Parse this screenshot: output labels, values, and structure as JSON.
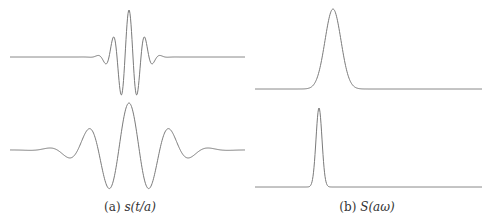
{
  "chart_data": [
    {
      "type": "line",
      "panel": "a",
      "caption": "(a) s(t/a)",
      "description": "Wavelet s(t/a), small scale a (compressed, top) and larger scale a (dilated, bottom)",
      "series": [
        {
          "name": "small scale",
          "shape": "gabor-like wavelet",
          "center_x": 129,
          "baseline_y": 57,
          "peak_y": 10,
          "trough_y": 93,
          "oscillation_period_px": 16,
          "envelope_sigma_px": 12
        },
        {
          "name": "large scale",
          "shape": "gabor-like wavelet",
          "center_x": 129,
          "baseline_y": 150,
          "peak_y": 103,
          "trough_y": 187,
          "oscillation_period_px": 41,
          "envelope_sigma_px": 32
        }
      ],
      "grid": false,
      "axes": false
    },
    {
      "type": "line",
      "panel": "b",
      "caption": "(b) S(aω)",
      "description": "Spectrum S(aω): wider band at higher frequency (top), narrower band at lower frequency (bottom)",
      "series": [
        {
          "name": "small scale spectrum",
          "shape": "gaussian",
          "center_x": 333,
          "baseline_y": 89,
          "peak_y": 9,
          "sigma_px": 8
        },
        {
          "name": "large scale spectrum",
          "shape": "gaussian",
          "center_x": 319,
          "baseline_y": 187,
          "peak_y": 108,
          "sigma_px": 3
        }
      ],
      "grid": false,
      "axes": false
    }
  ],
  "captions": {
    "a_prefix": "(a) ",
    "a_math": "s(t/a)",
    "b_prefix": "(b) ",
    "b_math": "S(aω)"
  },
  "colors": {
    "line": "#7a7a7a",
    "background": "#ffffff"
  }
}
